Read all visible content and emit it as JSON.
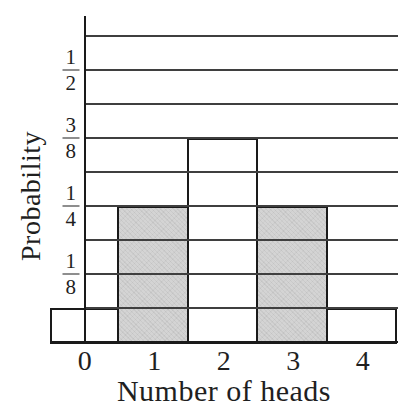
{
  "figure": {
    "ylabel": "Probability",
    "xlabel": "Number of heads"
  },
  "chart_data": {
    "type": "bar",
    "title": "",
    "xlabel": "Number of heads",
    "ylabel": "Probability",
    "categories": [
      "0",
      "1",
      "2",
      "3",
      "4"
    ],
    "values": [
      0.0625,
      0.25,
      0.375,
      0.25,
      0.0625
    ],
    "value_fractions": [
      "1/16",
      "1/4",
      "3/8",
      "1/4",
      "1/16"
    ],
    "shaded": [
      false,
      true,
      false,
      true,
      false
    ],
    "ylim": [
      0,
      0.5625
    ],
    "gridline_step": 0.0625,
    "gridline_count": 9,
    "grid": "horizontal",
    "legend": "none",
    "y_tick_labels": [
      {
        "numerator": "1",
        "denominator": "2",
        "value": 0.5
      },
      {
        "numerator": "3",
        "denominator": "8",
        "value": 0.375
      },
      {
        "numerator": "1",
        "denominator": "4",
        "value": 0.25
      },
      {
        "numerator": "1",
        "denominator": "8",
        "value": 0.125
      }
    ],
    "colors": {
      "line": "#1a1a1a",
      "gridline": "#3f3f3f",
      "bar_fill_shaded": "#d3d3d3",
      "bar_fill_plain": "#ffffff",
      "background": "#ffffff",
      "text": "#1f1f1f"
    }
  }
}
